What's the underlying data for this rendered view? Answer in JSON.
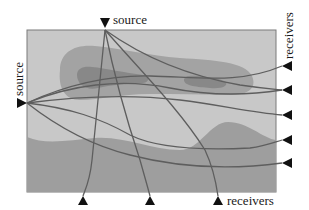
{
  "diagram": {
    "type": "seismic-tomography-ray-diagram",
    "labels": {
      "top_source": "source",
      "left_source": "source",
      "right_receivers": "receivers",
      "bottom_receivers": "receivers"
    },
    "colors": {
      "background": "#ffffff",
      "medium_light": "#c8c8c8",
      "zone_medium": "#a3a3a3",
      "zone_dark": "#888888",
      "lower_layer": "#9e9e9e",
      "border": "#7a7a7a",
      "ray": "#5e5e5e",
      "marker": "#111111"
    },
    "sources": [
      {
        "id": "top",
        "x": 105,
        "y": 28
      },
      {
        "id": "left",
        "x": 27,
        "y": 103
      }
    ],
    "receivers_right": [
      {
        "x": 282,
        "y": 66
      },
      {
        "x": 282,
        "y": 90
      },
      {
        "x": 282,
        "y": 115
      },
      {
        "x": 282,
        "y": 140
      },
      {
        "x": 282,
        "y": 163
      }
    ],
    "receivers_bottom": [
      {
        "x": 83,
        "y": 196
      },
      {
        "x": 150,
        "y": 196
      },
      {
        "x": 218,
        "y": 196
      }
    ]
  }
}
